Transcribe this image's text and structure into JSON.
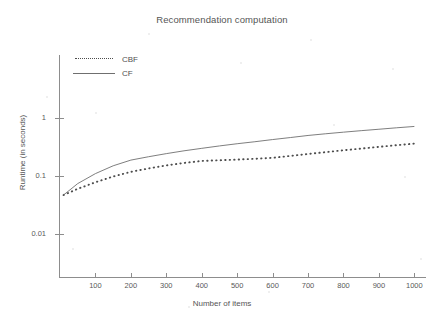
{
  "chart_data": {
    "type": "line",
    "title": "Recommendation computation",
    "xlabel": "Number of items",
    "ylabel": "Runtime (in seconds)",
    "yscale": "log",
    "ylim": [
      0.003,
      3.0
    ],
    "xlim": [
      0,
      1030
    ],
    "grid": false,
    "legend_position": "top-left",
    "xticks": [
      100,
      200,
      300,
      400,
      500,
      600,
      700,
      800,
      900,
      1000
    ],
    "xtick_labels": [
      "100",
      "200",
      "300",
      "400",
      "500",
      "600",
      "700",
      "800",
      "900",
      "1000"
    ],
    "yticks": [
      1,
      0.1,
      0.01
    ],
    "ytick_labels": [
      "1",
      "0.1",
      "0.01"
    ],
    "x": [
      10,
      50,
      100,
      150,
      200,
      250,
      300,
      350,
      400,
      450,
      500,
      550,
      600,
      650,
      700,
      750,
      800,
      850,
      900,
      950,
      1000
    ],
    "series": [
      {
        "name": "CBF",
        "style": "dotted",
        "color": "#4d4d4d",
        "values": [
          0.047,
          0.06,
          0.078,
          0.098,
          0.118,
          0.135,
          0.152,
          0.168,
          0.182,
          0.187,
          0.192,
          0.198,
          0.206,
          0.222,
          0.24,
          0.258,
          0.278,
          0.297,
          0.318,
          0.34,
          0.362
        ]
      },
      {
        "name": "CF",
        "style": "solid",
        "color": "#6f6f6f",
        "values": [
          0.047,
          0.074,
          0.11,
          0.15,
          0.188,
          0.215,
          0.243,
          0.272,
          0.3,
          0.33,
          0.36,
          0.39,
          0.425,
          0.46,
          0.5,
          0.535,
          0.57,
          0.605,
          0.64,
          0.678,
          0.715
        ]
      }
    ]
  },
  "legend": {
    "entries": [
      {
        "label": "CBF"
      },
      {
        "label": "CF"
      }
    ]
  },
  "colors": {
    "axis": "#8d8d8d",
    "text": "#555555",
    "cbf": "#4d4d4d",
    "cf": "#6f6f6f",
    "background": "#ffffff"
  }
}
